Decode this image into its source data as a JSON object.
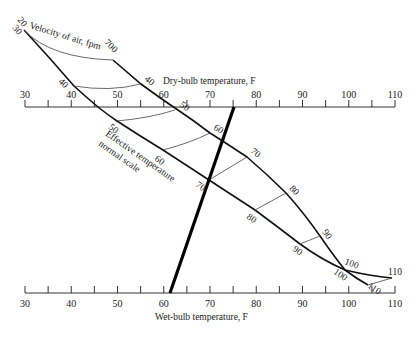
{
  "chart_data": {
    "type": "nomogram",
    "title": "",
    "dry_bulb_axis": {
      "title": "Dry-bulb temperature, F",
      "ticks": [
        30,
        40,
        50,
        60,
        70,
        80,
        90,
        100,
        110
      ],
      "minor_ticks": [
        35,
        45,
        55,
        65,
        75,
        85,
        95,
        105
      ],
      "range": [
        30,
        110
      ]
    },
    "wet_bulb_axis": {
      "title": "Wet-bulb temperature, F",
      "ticks": [
        30,
        40,
        50,
        60,
        70,
        80,
        90,
        100,
        110
      ],
      "minor_ticks": [
        35,
        45,
        55,
        65,
        75,
        85,
        95,
        105
      ],
      "range": [
        30,
        110
      ]
    },
    "velocity_label": "Velocity of air, fpm",
    "velocity_lines": [
      {
        "name": "20",
        "label_top": "20"
      },
      {
        "name": "30",
        "label_top": "30"
      },
      {
        "name": "700",
        "label_top": "700"
      }
    ],
    "effective_temperature_label": [
      "Effective temperature",
      "normal scale"
    ],
    "effective_temperature_values": [
      40,
      50,
      60,
      70,
      80,
      90,
      100,
      110
    ],
    "example_line": {
      "dry_bulb": 76,
      "wet_bulb": 62,
      "effective_temperature": 70
    }
  },
  "labels": {
    "dry_bulb_title": "Dry-bulb temperature, F",
    "wet_bulb_title": "Wet-bulb temperature, F",
    "velocity_title": "Velocity of air, fpm",
    "et_title_1": "Effective temperature",
    "et_title_2": "normal scale",
    "v20": "20",
    "v30": "30",
    "v700": "700",
    "ticks": [
      "30",
      "40",
      "50",
      "60",
      "70",
      "80",
      "90",
      "100",
      "110"
    ],
    "upper_curve": [
      "40",
      "50",
      "60",
      "70",
      "80",
      "90",
      "100",
      "110"
    ],
    "lower_curve": [
      "40",
      "50",
      "60",
      "70",
      "80",
      "90",
      "100",
      "110"
    ]
  }
}
